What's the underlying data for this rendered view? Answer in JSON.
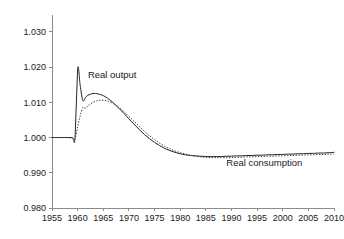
{
  "chart_data": {
    "type": "line",
    "title": "",
    "xlabel": "",
    "ylabel": "",
    "xlim": [
      1955,
      2010
    ],
    "ylim": [
      0.98,
      1.0345
    ],
    "grid": false,
    "legend_position": "inline-annotations",
    "xticks": [
      1955,
      1960,
      1965,
      1970,
      1975,
      1980,
      1985,
      1990,
      1995,
      2000,
      2005,
      2010
    ],
    "xtick_labels": [
      "1955",
      "1960",
      "1965",
      "1970",
      "1975",
      "1980",
      "1985",
      "1990",
      "1995",
      "2000",
      "2005",
      "2010"
    ],
    "yticks": [
      0.98,
      0.99,
      1.0,
      1.01,
      1.02,
      1.03
    ],
    "ytick_labels": [
      "0.980",
      "0.990",
      "1.000",
      "1.010",
      "1.020",
      "1.030"
    ],
    "annotations": [
      {
        "text": "Real output",
        "x": 1962.0,
        "y": 1.0168
      },
      {
        "text": "Real consumption",
        "x": 1989.0,
        "y": 0.992
      }
    ],
    "series": [
      {
        "name": "Real output",
        "style": "solid",
        "color": "#262626",
        "x": [
          1955,
          1956,
          1957,
          1958,
          1959,
          1959.5,
          1960,
          1960.5,
          1961,
          1961.5,
          1962,
          1963,
          1964,
          1965,
          1966,
          1967,
          1968,
          1969,
          1970,
          1971,
          1972,
          1973,
          1974,
          1975,
          1976,
          1977,
          1978,
          1979,
          1980,
          1981,
          1982,
          1983,
          1984,
          1985,
          1986,
          1987,
          1988,
          1989,
          1990,
          1991,
          1992,
          1993,
          1994,
          1995,
          1996,
          1997,
          1998,
          1999,
          2000,
          2001,
          2002,
          2003,
          2004,
          2005,
          2006,
          2007,
          2008,
          2009,
          2010
        ],
        "y": [
          1.0,
          1.0,
          1.0,
          1.0,
          1.0,
          1.0,
          1.0195,
          1.0148,
          1.0105,
          1.0113,
          1.012,
          1.0125,
          1.0124,
          1.0119,
          1.011,
          1.0098,
          1.0084,
          1.0069,
          1.0053,
          1.0038,
          1.0023,
          1.0009,
          0.9997,
          0.9986,
          0.9977,
          0.9969,
          0.9963,
          0.9958,
          0.9954,
          0.9951,
          0.9949,
          0.9948,
          0.9947,
          0.9946,
          0.9946,
          0.9946,
          0.9946,
          0.9947,
          0.9947,
          0.9948,
          0.9948,
          0.9949,
          0.9949,
          0.995,
          0.995,
          0.9951,
          0.9951,
          0.9952,
          0.9952,
          0.9953,
          0.9953,
          0.9954,
          0.9954,
          0.9955,
          0.9955,
          0.9956,
          0.9956,
          0.9957,
          0.9958
        ]
      },
      {
        "name": "Real consumption",
        "style": "dotted",
        "color": "#3d3d3d",
        "x": [
          1955,
          1956,
          1957,
          1958,
          1959,
          1959.5,
          1960,
          1960.5,
          1961,
          1961.5,
          1962,
          1963,
          1964,
          1965,
          1966,
          1967,
          1968,
          1969,
          1970,
          1971,
          1972,
          1973,
          1974,
          1975,
          1976,
          1977,
          1978,
          1979,
          1980,
          1981,
          1982,
          1983,
          1984,
          1985,
          1986,
          1987,
          1988,
          1989,
          1990,
          1991,
          1992,
          1993,
          1994,
          1995,
          1996,
          1997,
          1998,
          1999,
          2000,
          2001,
          2002,
          2003,
          2004,
          2005,
          2006,
          2007,
          2008,
          2009,
          2010
        ],
        "y": [
          1.0,
          1.0,
          1.0,
          1.0,
          0.9998,
          0.9996,
          1.003,
          1.0062,
          1.0085,
          1.0083,
          1.009,
          1.01,
          1.0105,
          1.0106,
          1.0103,
          1.0096,
          1.0086,
          1.0074,
          1.006,
          1.0046,
          1.0032,
          1.0018,
          1.0005,
          0.9994,
          0.9984,
          0.9975,
          0.9968,
          0.9962,
          0.9957,
          0.9953,
          0.995,
          0.9947,
          0.9945,
          0.9944,
          0.9943,
          0.9943,
          0.9943,
          0.9943,
          0.9943,
          0.9944,
          0.9944,
          0.9945,
          0.9945,
          0.9946,
          0.9946,
          0.9947,
          0.9947,
          0.9948,
          0.9948,
          0.9949,
          0.9949,
          0.995,
          0.995,
          0.9951,
          0.9951,
          0.9952,
          0.9952,
          0.9953,
          0.9953
        ]
      }
    ]
  },
  "layout": {
    "plot_left": 52,
    "plot_right": 334,
    "plot_top": 16,
    "plot_bottom": 208,
    "tick_length": 3
  }
}
